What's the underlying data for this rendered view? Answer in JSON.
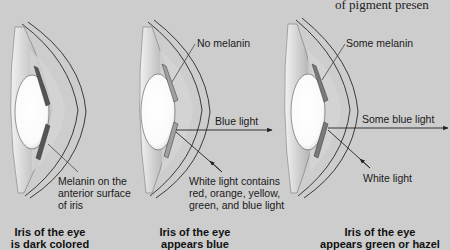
{
  "header": {
    "partial_text": "of pigment presen"
  },
  "panels": [
    {
      "id": "dark",
      "annotation_lines": [
        "Melanin on the",
        "anterior surface",
        "of iris"
      ],
      "caption_lines": [
        "Iris of the eye",
        "is dark colored"
      ]
    },
    {
      "id": "blue",
      "annotation": "No melanin",
      "light_out": "Blue light",
      "light_in_lines": [
        "White light contains",
        "red, orange, yellow,",
        "green, and blue light"
      ],
      "caption_lines": [
        "Iris of the eye",
        "appears blue"
      ]
    },
    {
      "id": "green-hazel",
      "annotation": "Some melanin",
      "light_out": "Some blue light",
      "light_in": "White light",
      "caption_lines": [
        "Iris of the eye",
        "appears green or hazel"
      ]
    }
  ],
  "colors": {
    "background": "#cdcdcd",
    "outline": "#3a3a3a",
    "lens": "#ffffff",
    "iris_dark": "#555555",
    "iris_light": "#9a9a9a"
  }
}
